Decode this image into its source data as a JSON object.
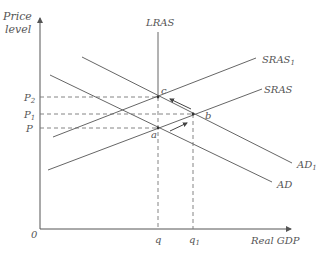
{
  "diagram": {
    "type": "aggregate-demand-aggregate-supply",
    "y_axis_label_line1": "Price",
    "y_axis_label_line2": "level",
    "x_axis_label": "Real GDP",
    "origin_label": "0",
    "curves": {
      "lras": "LRAS",
      "sras": "SRAS",
      "sras1_base": "SRAS",
      "sras1_sub": "1",
      "ad": "AD",
      "ad1_base": "AD",
      "ad1_sub": "1"
    },
    "price_levels": {
      "p2_base": "P",
      "p2_sub": "2",
      "p1_base": "P",
      "p1_sub": "1",
      "p": "P"
    },
    "quantities": {
      "q": "q",
      "q1_base": "q",
      "q1_sub": "1"
    },
    "points": {
      "a": "a",
      "b": "b",
      "c": "c"
    }
  }
}
